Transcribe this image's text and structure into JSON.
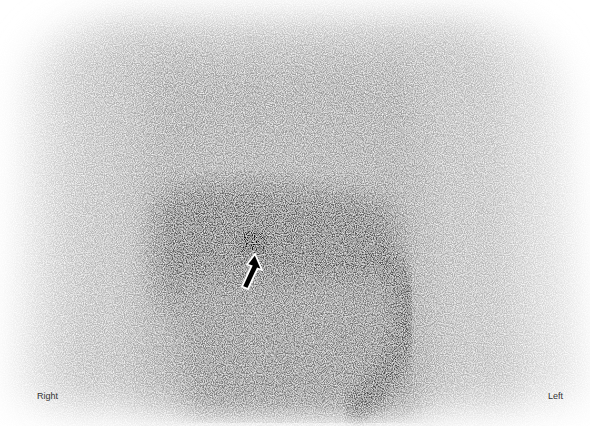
{
  "image": {
    "type": "scintigraphy",
    "description": "Grayscale nuclear medicine abdominal scan with focal hot spot indicated by arrow",
    "orientation_labels": {
      "right": "Right",
      "left": "Left"
    },
    "annotation": {
      "arrow": "white outlined arrow pointing to focal uptake",
      "arrow_tip": [
        255,
        255
      ],
      "hotspot_center": [
        253,
        243
      ]
    }
  }
}
